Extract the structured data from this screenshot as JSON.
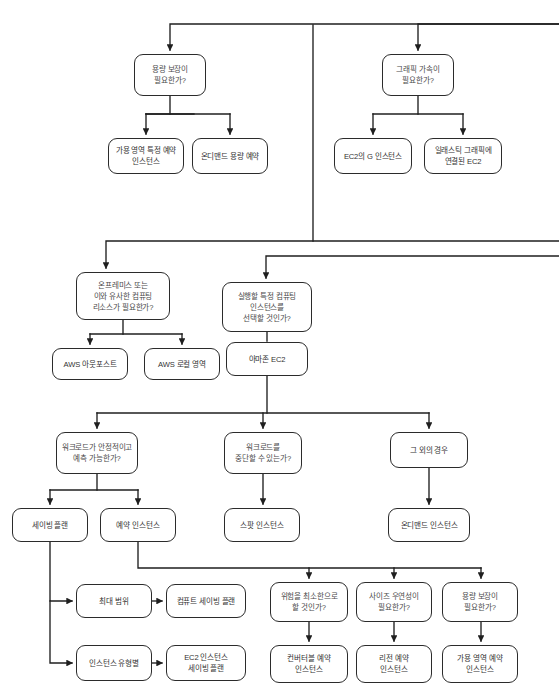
{
  "diagram": {
    "type": "flowchart",
    "style": {
      "background": "#ffffff",
      "node_stroke": "#2b2b2b",
      "node_fill": "#ffffff",
      "decision_text": "#4a4a4a",
      "terminal_text": "#333333",
      "edge_stroke": "#1f1f1f"
    },
    "nodes": [
      {
        "id": "cap_guarantee_q",
        "label": "용량 보장이\n필요한가?",
        "kind": "decision",
        "x": 134,
        "y": 54,
        "w": 72,
        "h": 42
      },
      {
        "id": "az_reserved",
        "label": "가용 영역 특정 예약\n인스턴스",
        "kind": "terminal",
        "x": 108,
        "y": 138,
        "w": 76,
        "h": 36
      },
      {
        "id": "ondemand_cap_res",
        "label": "온디맨드 용량 예약",
        "kind": "terminal",
        "x": 192,
        "y": 138,
        "w": 76,
        "h": 36
      },
      {
        "id": "gpu_q",
        "label": "그래픽 가속이\n필요한가?",
        "kind": "decision",
        "x": 382,
        "y": 54,
        "w": 72,
        "h": 42
      },
      {
        "id": "ec2_g",
        "label": "EC2의 G 인스턴스",
        "kind": "terminal",
        "x": 334,
        "y": 138,
        "w": 78,
        "h": 36
      },
      {
        "id": "elastic_graphics",
        "label": "일래스틱 그래픽에\n연결된 EC2",
        "kind": "terminal",
        "x": 424,
        "y": 138,
        "w": 78,
        "h": 36
      },
      {
        "id": "onprem_q",
        "label": "온프레미스 또는\n이와 유사한 컴퓨팅\n리소스가 필요한가?",
        "kind": "decision",
        "x": 76,
        "y": 272,
        "w": 94,
        "h": 48
      },
      {
        "id": "aws_outposts",
        "label": "AWS 아웃포스트",
        "kind": "terminal",
        "x": 52,
        "y": 348,
        "w": 76,
        "h": 32
      },
      {
        "id": "aws_local_zones",
        "label": "AWS 로컬 영역",
        "kind": "terminal",
        "x": 144,
        "y": 348,
        "w": 76,
        "h": 32
      },
      {
        "id": "specific_inst_q",
        "label": "실행할 특정 컴퓨팅\n인스턴스를\n선택할 것인가?",
        "kind": "decision",
        "x": 222,
        "y": 282,
        "w": 90,
        "h": 50
      },
      {
        "id": "amazon_ec2",
        "label": "아마존 EC2",
        "kind": "terminal",
        "x": 226,
        "y": 342,
        "w": 82,
        "h": 34
      },
      {
        "id": "stable_q",
        "label": "워크로드가 안정적이고\n예측 가능한가?",
        "kind": "decision",
        "x": 56,
        "y": 432,
        "w": 82,
        "h": 42
      },
      {
        "id": "interrupt_q",
        "label": "워크로드를\n중단할 수 있는가?",
        "kind": "decision",
        "x": 224,
        "y": 432,
        "w": 78,
        "h": 42
      },
      {
        "id": "otherwise",
        "label": "그 외의 경우",
        "kind": "terminal",
        "x": 390,
        "y": 432,
        "w": 78,
        "h": 36
      },
      {
        "id": "savings_plan",
        "label": "세이빙 플랜",
        "kind": "terminal",
        "x": 12,
        "y": 508,
        "w": 76,
        "h": 34
      },
      {
        "id": "reserved_inst",
        "label": "예약 인스턴스",
        "kind": "terminal",
        "x": 100,
        "y": 508,
        "w": 76,
        "h": 34
      },
      {
        "id": "spot_inst",
        "label": "스팟 인스턴스",
        "kind": "terminal",
        "x": 224,
        "y": 508,
        "w": 76,
        "h": 34
      },
      {
        "id": "ondemand_inst",
        "label": "온디맨드 인스턴스",
        "kind": "terminal",
        "x": 388,
        "y": 508,
        "w": 82,
        "h": 34
      },
      {
        "id": "max_scope",
        "label": "최대 범위",
        "kind": "terminal",
        "x": 76,
        "y": 584,
        "w": 76,
        "h": 34
      },
      {
        "id": "compute_sp",
        "label": "컴퓨트 세이빙 플랜",
        "kind": "terminal",
        "x": 166,
        "y": 584,
        "w": 80,
        "h": 34
      },
      {
        "id": "by_inst_type",
        "label": "인스턴스 유형별",
        "kind": "terminal",
        "x": 76,
        "y": 645,
        "w": 76,
        "h": 36
      },
      {
        "id": "ec2_inst_sp",
        "label": "EC2 인스턴스\n세이빙 플랜",
        "kind": "terminal",
        "x": 166,
        "y": 645,
        "w": 80,
        "h": 36
      },
      {
        "id": "min_risk_q",
        "label": "위험을 최소한으로\n할 것인가?",
        "kind": "decision",
        "x": 270,
        "y": 582,
        "w": 78,
        "h": 40
      },
      {
        "id": "size_flex_q",
        "label": "사이즈 우연성이\n필요한가?",
        "kind": "decision",
        "x": 356,
        "y": 582,
        "w": 76,
        "h": 40
      },
      {
        "id": "cap_guarantee_q2",
        "label": "용량 보장이\n필요한가?",
        "kind": "decision",
        "x": 442,
        "y": 582,
        "w": 76,
        "h": 40
      },
      {
        "id": "convertible_ri",
        "label": "컨버터블 예약\n인스턴스",
        "kind": "terminal",
        "x": 270,
        "y": 645,
        "w": 78,
        "h": 38
      },
      {
        "id": "regional_ri",
        "label": "리전 예약\n인스턴스",
        "kind": "terminal",
        "x": 356,
        "y": 645,
        "w": 76,
        "h": 38
      },
      {
        "id": "az_ri",
        "label": "가용 영역 예약\n인스턴스",
        "kind": "terminal",
        "x": 442,
        "y": 645,
        "w": 76,
        "h": 38
      }
    ],
    "edges": [
      {
        "from": "bus-top-left",
        "to": "cap_guarantee_q",
        "kind": "elbow-down"
      },
      {
        "from": "cap_guarantee_q",
        "to": "az_reserved",
        "kind": "split"
      },
      {
        "from": "cap_guarantee_q",
        "to": "ondemand_cap_res",
        "kind": "split"
      },
      {
        "from": "bus-top-right",
        "to": "gpu_q",
        "kind": "elbow-down"
      },
      {
        "from": "gpu_q",
        "to": "ec2_g",
        "kind": "split"
      },
      {
        "from": "gpu_q",
        "to": "elastic_graphics",
        "kind": "split"
      },
      {
        "from": "bus-mid",
        "to": "onprem_q",
        "kind": "elbow-down"
      },
      {
        "from": "onprem_q",
        "to": "aws_outposts",
        "kind": "split"
      },
      {
        "from": "onprem_q",
        "to": "aws_local_zones",
        "kind": "split"
      },
      {
        "from": "bus-mid2",
        "to": "specific_inst_q",
        "kind": "elbow-down"
      },
      {
        "from": "specific_inst_q",
        "to": "amazon_ec2",
        "kind": "straight"
      },
      {
        "from": "amazon_ec2",
        "to": "stable_q",
        "kind": "split3"
      },
      {
        "from": "amazon_ec2",
        "to": "interrupt_q",
        "kind": "split3"
      },
      {
        "from": "amazon_ec2",
        "to": "otherwise",
        "kind": "split3"
      },
      {
        "from": "stable_q",
        "to": "savings_plan",
        "kind": "split"
      },
      {
        "from": "stable_q",
        "to": "reserved_inst",
        "kind": "split"
      },
      {
        "from": "interrupt_q",
        "to": "spot_inst",
        "kind": "straight"
      },
      {
        "from": "otherwise",
        "to": "ondemand_inst",
        "kind": "straight"
      },
      {
        "from": "savings_plan",
        "to": "max_scope",
        "kind": "elbow-right"
      },
      {
        "from": "savings_plan",
        "to": "by_inst_type",
        "kind": "elbow-right"
      },
      {
        "from": "max_scope",
        "to": "compute_sp",
        "kind": "horizontal"
      },
      {
        "from": "by_inst_type",
        "to": "ec2_inst_sp",
        "kind": "horizontal"
      },
      {
        "from": "reserved_inst",
        "to": "min_risk_q",
        "kind": "elbow-bus"
      },
      {
        "from": "reserved_inst",
        "to": "size_flex_q",
        "kind": "elbow-bus"
      },
      {
        "from": "reserved_inst",
        "to": "cap_guarantee_q2",
        "kind": "elbow-bus"
      },
      {
        "from": "min_risk_q",
        "to": "convertible_ri",
        "kind": "straight"
      },
      {
        "from": "size_flex_q",
        "to": "regional_ri",
        "kind": "straight"
      },
      {
        "from": "cap_guarantee_q2",
        "to": "az_ri",
        "kind": "straight"
      }
    ]
  }
}
